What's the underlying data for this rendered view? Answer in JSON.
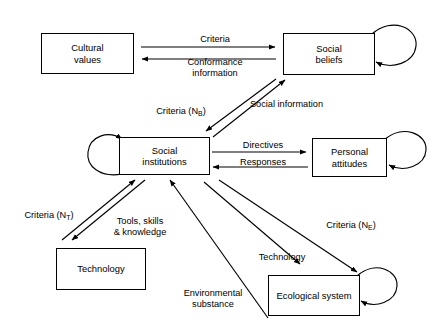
{
  "diagram": {
    "line_color": "#000000",
    "background_color": "#ffffff",
    "nodes": [
      {
        "id": "cultural-values",
        "label_line1": "Cultural",
        "label_line2": "values",
        "x": 41,
        "y": 33,
        "w": 93,
        "h": 41,
        "self_loop": false
      },
      {
        "id": "social-beliefs",
        "label_line1": "Social",
        "label_line2": "beliefs",
        "x": 283,
        "y": 33,
        "w": 92,
        "h": 42,
        "self_loop": true
      },
      {
        "id": "social-institutions",
        "label_line1": "Social",
        "label_line2": "institutions",
        "x": 119,
        "y": 137,
        "w": 91,
        "h": 38,
        "self_loop": true
      },
      {
        "id": "personal-attitudes",
        "label_line1": "Personal",
        "label_line2": "attitudes",
        "x": 312,
        "y": 138,
        "w": 75,
        "h": 39,
        "self_loop": true
      },
      {
        "id": "technology",
        "label_line1": "Technology",
        "label_line2": "",
        "x": 56,
        "y": 248,
        "w": 90,
        "h": 42,
        "self_loop": false
      },
      {
        "id": "ecological-system",
        "label_line1": "Ecological system",
        "label_line2": "",
        "x": 268,
        "y": 275,
        "w": 92,
        "h": 41,
        "self_loop": true
      }
    ],
    "edge_labels": [
      {
        "id": "criteria-cv-sb",
        "text": "Criteria",
        "x": 180,
        "y": 34,
        "w": 70
      },
      {
        "id": "conformance-information",
        "text": "Conformance\ninformation",
        "x": 172,
        "y": 56,
        "w": 86
      },
      {
        "id": "criteria-nb",
        "text": "Criteria (N",
        "sub": "B",
        "suffix": ")",
        "x": 146,
        "y": 105,
        "w": 70
      },
      {
        "id": "social-information",
        "text": "Social information",
        "x": 239,
        "y": 99,
        "w": 95
      },
      {
        "id": "directives",
        "text": "Directives",
        "x": 233,
        "y": 139,
        "w": 60
      },
      {
        "id": "responses",
        "text": "Responses",
        "x": 232,
        "y": 157,
        "w": 62
      },
      {
        "id": "criteria-nt",
        "text": "Criteria (N",
        "sub": "T",
        "suffix": ")",
        "x": 14,
        "y": 209,
        "w": 70
      },
      {
        "id": "tools-skills-knowledge",
        "text": "Tools, skills\n& knowledge",
        "x": 102,
        "y": 216,
        "w": 78
      },
      {
        "id": "criteria-ne",
        "text": "Criteria (N",
        "sub": "E",
        "suffix": ")",
        "x": 316,
        "y": 219,
        "w": 70
      },
      {
        "id": "technology-flow",
        "text": "Technology",
        "x": 249,
        "y": 251,
        "w": 66
      },
      {
        "id": "environmental-substance",
        "text": "Environmental\nsubstance",
        "x": 170,
        "y": 288,
        "w": 88
      }
    ],
    "edges": [
      {
        "id": "cv-to-sb-criteria",
        "from": "cultural-values",
        "to": "social-beliefs",
        "label": "Criteria"
      },
      {
        "id": "sb-to-cv-conformance",
        "from": "social-beliefs",
        "to": "cultural-values",
        "label": "Conformance information"
      },
      {
        "id": "sb-to-si-criteria-nb",
        "from": "social-beliefs",
        "to": "social-institutions",
        "label": "Criteria (NB)"
      },
      {
        "id": "si-to-sb-social-information",
        "from": "social-institutions",
        "to": "social-beliefs",
        "label": "Social information"
      },
      {
        "id": "si-to-pa-directives",
        "from": "social-institutions",
        "to": "personal-attitudes",
        "label": "Directives"
      },
      {
        "id": "pa-to-si-responses",
        "from": "personal-attitudes",
        "to": "social-institutions",
        "label": "Responses"
      },
      {
        "id": "si-to-tech-criteria-nt",
        "from": "social-institutions",
        "to": "technology",
        "label": "Criteria (NT)"
      },
      {
        "id": "tech-to-si-tools",
        "from": "technology",
        "to": "social-institutions",
        "label": "Tools, skills & knowledge"
      },
      {
        "id": "si-to-eco-criteria-ne",
        "from": "social-institutions",
        "to": "ecological-system",
        "label": "Criteria (NE)"
      },
      {
        "id": "si-to-eco-technology",
        "from": "social-institutions",
        "to": "ecological-system",
        "label": "Technology"
      },
      {
        "id": "eco-to-si-environmental-substance",
        "from": "ecological-system",
        "to": "social-institutions",
        "label": "Environmental substance"
      }
    ]
  }
}
